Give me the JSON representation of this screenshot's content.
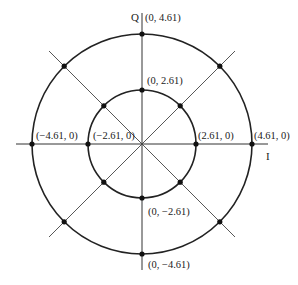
{
  "diagram": {
    "type": "constellation",
    "axes": {
      "horizontal_label": "I",
      "vertical_label": "Q"
    },
    "inner_circle": {
      "radius_value": 2.61,
      "points": [
        {
          "label": "(0, 2.61)"
        },
        {
          "label": "(2.61, 0)"
        },
        {
          "label": "(0, −2.61)"
        },
        {
          "label": "(−2.61, 0)"
        }
      ]
    },
    "outer_circle": {
      "radius_value": 4.61,
      "points": [
        {
          "label": "(0, 4.61)"
        },
        {
          "label": "(4.61, 0)"
        },
        {
          "label": "(0, −4.61)"
        },
        {
          "label": "(−4.61, 0)"
        }
      ]
    },
    "diagonal_points": "unlabeled points at 45°, 135°, 225°, 315° on both circles",
    "colors": {
      "stroke": "#222222",
      "background": "#ffffff"
    }
  }
}
